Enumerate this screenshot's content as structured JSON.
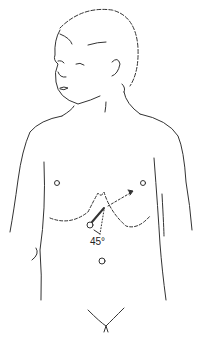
{
  "figure": {
    "angle_label": "45°",
    "colors": {
      "line": "#333333",
      "background": "#ffffff"
    }
  }
}
